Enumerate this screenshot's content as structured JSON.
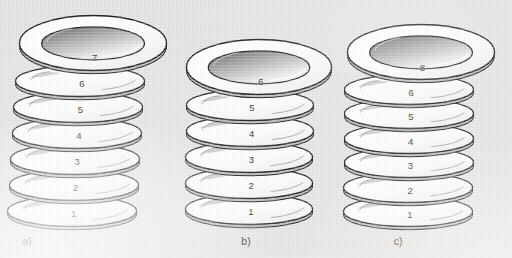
{
  "figure": {
    "kind": "line-art-illustration",
    "background_color": "#e3e3e1",
    "line_color": "#1a1a1a",
    "plate_fill_color": "#fbfbfa",
    "shade_color": "#b9b9b7"
  },
  "stacks": [
    {
      "id": "a",
      "caption": "a)",
      "plate_count": 7,
      "alignment": "skewed",
      "plates": [
        {
          "label": "1"
        },
        {
          "label": "2"
        },
        {
          "label": "3"
        },
        {
          "label": "4"
        },
        {
          "label": "5"
        },
        {
          "label": "6"
        },
        {
          "label": "7"
        }
      ]
    },
    {
      "id": "b",
      "caption": "b)",
      "plate_count": 6,
      "alignment": "aligned",
      "plates": [
        {
          "label": "1"
        },
        {
          "label": "2"
        },
        {
          "label": "3"
        },
        {
          "label": "4"
        },
        {
          "label": "5"
        },
        {
          "label": "6"
        }
      ]
    },
    {
      "id": "c",
      "caption": "c)",
      "plate_count": 7,
      "alignment": "aligned",
      "plates": [
        {
          "label": "1"
        },
        {
          "label": "2"
        },
        {
          "label": "3"
        },
        {
          "label": "4"
        },
        {
          "label": "5"
        },
        {
          "label": "6"
        },
        {
          "label": "8"
        }
      ]
    }
  ]
}
